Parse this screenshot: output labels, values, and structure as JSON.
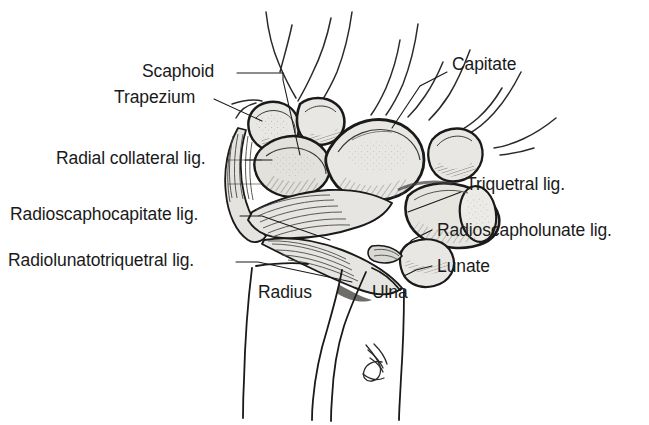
{
  "figure": {
    "background_color": "#ffffff",
    "ink_color": "#1a1a1a",
    "bone_fill_color": "#e8e7e3",
    "shadow_color": "#9b9a95",
    "width": 649,
    "height": 425
  },
  "labels": {
    "scaphoid": "Scaphoid",
    "trapezium": "Trapezium",
    "radial_collateral": "Radial collateral lig.",
    "radioscaphocapitate": "Radioscaphocapitate lig.",
    "radiolunatotriquetral": "Radiolunatotriquetral lig.",
    "capitate": "Capitate",
    "triquetral": "Triquetral lig.",
    "radioscapholunate": "Radioscapholunate lig.",
    "lunate": "Lunate",
    "radius": "Radius",
    "ulna": "Ulna"
  }
}
